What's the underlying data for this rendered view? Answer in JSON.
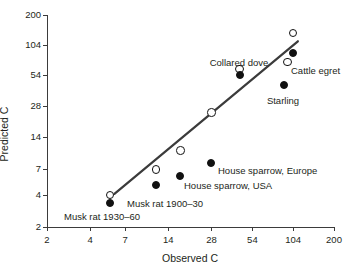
{
  "chart_data": {
    "type": "scatter",
    "title": "",
    "xlabel": "Observed C",
    "ylabel": "Predicted C",
    "scale": "log-log",
    "xticks": [
      2,
      4,
      7,
      14,
      28,
      54,
      104,
      200
    ],
    "yticks": [
      2,
      4,
      7,
      14,
      28,
      54,
      104,
      200
    ],
    "xlim": [
      2,
      200
    ],
    "ylim": [
      2,
      200
    ],
    "grid": false,
    "legend": "none",
    "marker_styles": {
      "open": "open circle",
      "filled": "filled circle"
    },
    "series": [
      {
        "name": "Predicted (open circles)",
        "marker": "open",
        "points": [
          {
            "label": "Musk rat 1930-60",
            "x": 5.5,
            "y": 4.0
          },
          {
            "label": "Musk rat 1900-30",
            "x": 11.5,
            "y": 7.0
          },
          {
            "label": "House sparrow, USA",
            "x": 17.0,
            "y": 10.5
          },
          {
            "label": "House sparrow, Europe",
            "x": 28.0,
            "y": 24.0
          },
          {
            "label": "Collared dove",
            "x": 44.0,
            "y": 62.0
          },
          {
            "label": "Cattle egret",
            "x": 95.0,
            "y": 72.0
          },
          {
            "label": "",
            "x": 104.0,
            "y": 135.0
          }
        ]
      },
      {
        "name": "Observed (filled circles)",
        "marker": "filled",
        "points": [
          {
            "label": "Musk rat 1930-60",
            "x": 5.5,
            "y": 3.4
          },
          {
            "label": "Musk rat 1900-30",
            "x": 11.5,
            "y": 5.0
          },
          {
            "label": "House sparrow, USA",
            "x": 17.0,
            "y": 6.0
          },
          {
            "label": "House sparrow, Europe",
            "x": 28.0,
            "y": 8.0
          },
          {
            "label": "Collared dove",
            "x": 44.0,
            "y": 54.0
          },
          {
            "label": "Cattle egret",
            "x": 104.0,
            "y": 88.0
          },
          {
            "label": "Starling",
            "x": 90.0,
            "y": 44.0
          }
        ]
      }
    ],
    "trendline": {
      "type": "line",
      "x_start": 5.9,
      "y_start": 4.1,
      "x_end": 112.0,
      "y_end": 113.0
    },
    "annotations": [
      {
        "text": "Collared dove",
        "x_px": 239,
        "y_px": 58,
        "align": "center"
      },
      {
        "text": "Cattle egret",
        "x_px": 291,
        "y_px": 66,
        "align": "left"
      },
      {
        "text": "Starling",
        "x_px": 283,
        "y_px": 96,
        "align": "center"
      },
      {
        "text": "House sparrow, Europe",
        "x_px": 218,
        "y_px": 166,
        "align": "left"
      },
      {
        "text": "House sparrow, USA",
        "x_px": 184,
        "y_px": 181,
        "align": "left"
      },
      {
        "text": "Musk rat 1900–30",
        "x_px": 127,
        "y_px": 199,
        "align": "left"
      },
      {
        "text": "Musk rat 1930–60",
        "x_px": 64,
        "y_px": 212,
        "align": "left"
      }
    ]
  },
  "axes": {
    "xlabel": "Observed C",
    "ylabel": "Predicted C",
    "xtick_labels": [
      "2",
      "4",
      "7",
      "14",
      "28",
      "54",
      "104",
      "200"
    ],
    "ytick_labels": [
      "2",
      "4",
      "7",
      "14",
      "28",
      "54",
      "104",
      "200"
    ]
  },
  "colors": {
    "marker_fill": "#111111",
    "marker_edge": "#111111",
    "axis": "#3b3b3b",
    "text": "#231f20",
    "trendline": "#3b3b3b",
    "background": "#ffffff"
  }
}
